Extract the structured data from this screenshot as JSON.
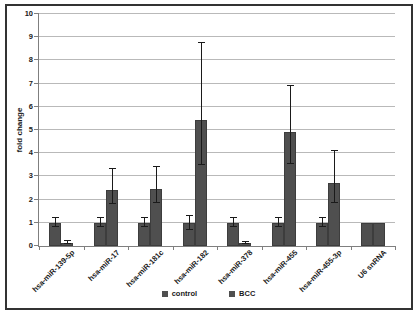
{
  "figure": {
    "ylabel": "fold change",
    "colors": {
      "bar": "#4f4f4f",
      "grid": "#b9b9b9",
      "axis": "#7f7f7f",
      "error": "#1a1a1a",
      "frame": "#333333",
      "text": "#1a1a1a"
    }
  },
  "chart_data": {
    "type": "bar",
    "title": "",
    "xlabel": "",
    "ylabel": "fold change",
    "ylim": [
      0,
      10
    ],
    "ytick_step": 1,
    "grid": true,
    "legend_position": "bottom",
    "categories": [
      "hsa-miR-139-5p",
      "hsa-miR-17",
      "hsa-miR-181c",
      "hsa-miR-182",
      "hsa-miR-378",
      "hsa-miR-455",
      "hsa-miR-455-3p",
      "U6 snRNA"
    ],
    "series": [
      {
        "name": "control",
        "color": "#4f4f4f",
        "values": [
          1,
          1,
          1,
          1,
          1,
          1,
          1,
          1
        ],
        "err_up": [
          0.2,
          0.2,
          0.2,
          0.3,
          0.2,
          0.2,
          0.2,
          0
        ],
        "err_dn": [
          0.2,
          0.2,
          0.2,
          0.3,
          0.2,
          0.2,
          0.2,
          0
        ]
      },
      {
        "name": "BCC",
        "color": "#4f4f4f",
        "values": [
          0.15,
          2.43,
          2.47,
          5.45,
          0.13,
          4.9,
          2.7,
          1
        ],
        "err_up": [
          0.07,
          0.9,
          0.95,
          3.3,
          0.05,
          2.0,
          1.4,
          0
        ],
        "err_dn": [
          0.07,
          0.6,
          0.6,
          1.95,
          0.05,
          1.35,
          0.85,
          0
        ]
      }
    ]
  }
}
